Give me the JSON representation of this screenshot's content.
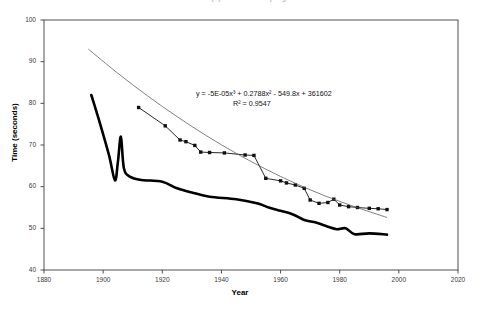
{
  "chart_data": {
    "type": "line",
    "title": "Men's 800m (?) world record progression",
    "xlabel": "Year",
    "ylabel": "Time (seconds)",
    "xlim": [
      1880,
      2020
    ],
    "ylim": [
      40,
      100
    ],
    "xticks": [
      1880,
      1900,
      1920,
      1940,
      1960,
      1980,
      2000,
      2020
    ],
    "yticks": [
      40,
      50,
      60,
      70,
      80,
      90,
      100
    ],
    "grid": false,
    "legend": "none",
    "annotations": [
      {
        "name": "trendline-equation",
        "equation": "y = -5E-05x3 + 0.2788x2 - 549.8x + 361602",
        "equation_display": "y = -5E-05x³ + 0.2788x² - 549.8x + 361602",
        "r_squared_display": "R² = 0.9547",
        "r_squared": 0.9547
      }
    ],
    "series": [
      {
        "name": "marked-data-series",
        "style": "line-with-square-markers",
        "color": "#101010",
        "points": [
          [
            1912,
            79.0
          ],
          [
            1921,
            74.6
          ],
          [
            1926,
            71.2
          ],
          [
            1928,
            70.8
          ],
          [
            1931,
            69.9
          ],
          [
            1933,
            68.3
          ],
          [
            1936,
            68.2
          ],
          [
            1941,
            68.1
          ],
          [
            1948,
            67.6
          ],
          [
            1951,
            67.5
          ],
          [
            1955,
            62.0
          ],
          [
            1960,
            61.4
          ],
          [
            1962,
            60.9
          ],
          [
            1965,
            60.4
          ],
          [
            1968,
            59.6
          ],
          [
            1970,
            56.8
          ],
          [
            1973,
            56.0
          ],
          [
            1976,
            56.2
          ],
          [
            1978,
            57.0
          ],
          [
            1980,
            55.6
          ],
          [
            1983,
            55.2
          ],
          [
            1986,
            55.0
          ],
          [
            1990,
            54.8
          ],
          [
            1993,
            54.7
          ],
          [
            1996,
            54.5
          ]
        ]
      },
      {
        "name": "thick-reference-series",
        "style": "thick-line-no-markers",
        "color": "#000000",
        "points": [
          [
            1896,
            82.0
          ],
          [
            1899,
            75.0
          ],
          [
            1902,
            67.5
          ],
          [
            1904,
            61.5
          ],
          [
            1905,
            66.0
          ],
          [
            1906,
            72.0
          ],
          [
            1907,
            64.5
          ],
          [
            1909,
            62.4
          ],
          [
            1913,
            61.6
          ],
          [
            1920,
            61.2
          ],
          [
            1925,
            59.6
          ],
          [
            1930,
            58.6
          ],
          [
            1936,
            57.6
          ],
          [
            1945,
            57.0
          ],
          [
            1952,
            56.0
          ],
          [
            1956,
            55.0
          ],
          [
            1960,
            54.2
          ],
          [
            1964,
            53.4
          ],
          [
            1968,
            52.0
          ],
          [
            1972,
            51.4
          ],
          [
            1976,
            50.4
          ],
          [
            1979,
            49.8
          ],
          [
            1982,
            50.0
          ],
          [
            1985,
            48.6
          ],
          [
            1990,
            48.8
          ],
          [
            1996,
            48.5
          ]
        ]
      },
      {
        "name": "polynomial-trendline",
        "style": "thin-smooth-curve",
        "color": "#555555",
        "points": [
          [
            1895,
            93.0
          ],
          [
            1905,
            87.2
          ],
          [
            1915,
            81.8
          ],
          [
            1925,
            76.8
          ],
          [
            1935,
            72.2
          ],
          [
            1945,
            68.0
          ],
          [
            1955,
            64.2
          ],
          [
            1965,
            60.8
          ],
          [
            1975,
            57.8
          ],
          [
            1985,
            55.2
          ],
          [
            1996,
            52.6
          ]
        ]
      }
    ]
  }
}
